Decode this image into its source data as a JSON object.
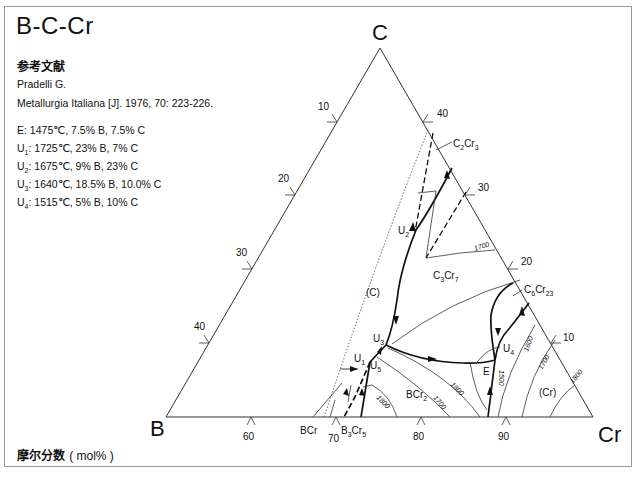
{
  "title": "B-C-Cr",
  "reference": {
    "heading": "参考文献",
    "author": "Pradelli G.",
    "citation": "Metallurgia Italiana [J]. 1976, 70: 223-226."
  },
  "invariant_points": [
    {
      "name": "E",
      "sub": "",
      "text": "1475℃, 7.5% B, 7.5% C"
    },
    {
      "name": "U",
      "sub": "1",
      "text": "1725℃, 23% B, 7% C"
    },
    {
      "name": "U",
      "sub": "2",
      "text": "1675℃, 9% B, 23% C"
    },
    {
      "name": "U",
      "sub": "3",
      "text": "1640℃, 18.5% B, 10.0% C"
    },
    {
      "name": "U",
      "sub": "4",
      "text": "1515℃, 5% B, 10% C"
    }
  ],
  "units_label": "摩尔分数",
  "units_value": "( mol% )",
  "diagram": {
    "vertices": {
      "top": "C",
      "left": "B",
      "right": "Cr"
    },
    "left_edge_ticks": [
      "10",
      "20",
      "30",
      "40"
    ],
    "right_edge_ticks": [
      "40",
      "30",
      "20",
      "10"
    ],
    "bottom_edge_ticks": [
      "60",
      "70",
      "80",
      "90"
    ],
    "phases": {
      "c2cr3": "C2Cr3",
      "c3cr7": "C3Cr7",
      "c6cr23": "C6Cr23",
      "bcr2": "BCr2",
      "bcr": "BCr",
      "b3cr5": "B3Cr5",
      "graphite": "(C)",
      "chromium": "(Cr)"
    },
    "point_labels": {
      "u1": "U1",
      "u2": "U2",
      "u3": "U3",
      "u4": "U4",
      "u5": "U5",
      "e": "E"
    },
    "isotherms": [
      "1700",
      "1800",
      "1700",
      "1800",
      "1500",
      "1600",
      "1700",
      "1800"
    ]
  }
}
